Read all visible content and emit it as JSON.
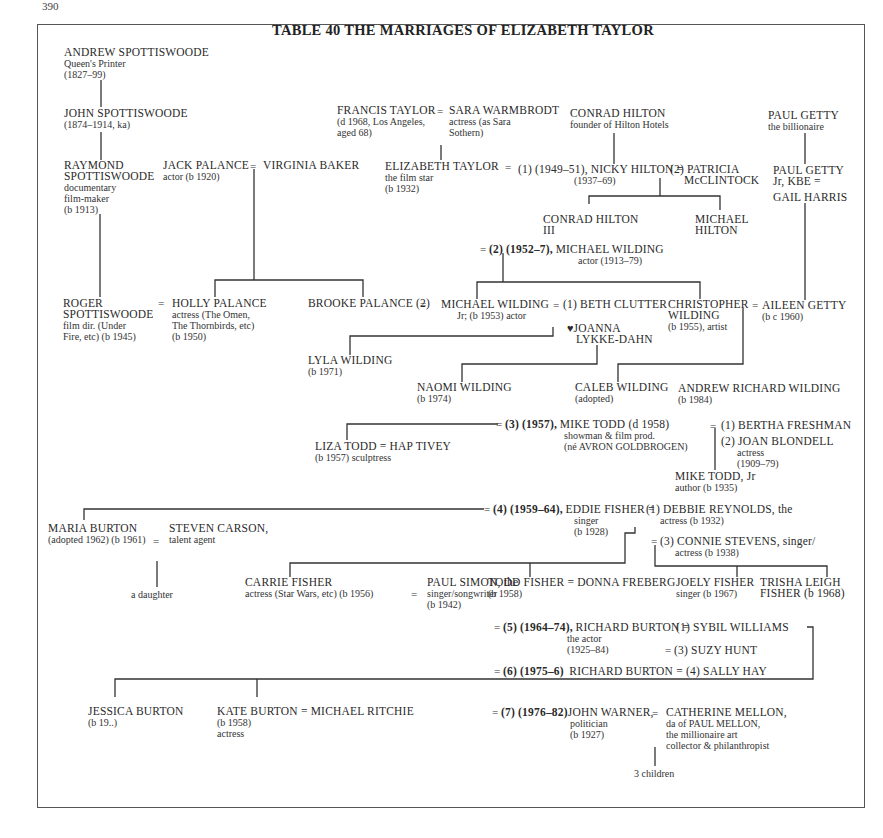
{
  "page_number": "390",
  "title": "TABLE 40 THE MARRIAGES OF ELIZABETH TAYLOR",
  "people": {
    "andrew_spottiswoode": {
      "name": "ANDREW SPOTTISWOODE",
      "line1": "Queen's Printer",
      "line2": "(1827–99)"
    },
    "john_spottiswoode": {
      "name": "JOHN SPOTTISWOODE",
      "line1": "(1874–1914, ka)"
    },
    "raymond_spottiswoode": {
      "name1": "RAYMOND",
      "name2": "SPOTTISWOODE",
      "line1": "documentary",
      "line2": "film-maker",
      "line3": "(b 1913)"
    },
    "roger_spottiswoode": {
      "name1": "ROGER",
      "name2": "SPOTTISWOODE",
      "line1": "film dir. (Under",
      "line2": "Fire, etc) (b 1945)"
    },
    "jack_palance": {
      "name": "JACK PALANCE",
      "line1": "actor (b 1920)"
    },
    "virginia_baker": {
      "name": "VIRGINIA BAKER"
    },
    "holly_palance": {
      "name": "HOLLY PALANCE",
      "line1": "actress (The Omen,",
      "line2": "The Thornbirds, etc)",
      "line3": "(b 1950)"
    },
    "brooke_palance": {
      "name": "BROOKE PALANCE (2)"
    },
    "francis_taylor": {
      "name": "FRANCIS TAYLOR",
      "line1": "(d 1968, Los Angeles,",
      "line2": "aged 68)"
    },
    "sara_warmbrodt": {
      "name": "SARA WARMBRODT",
      "line1": "actress (as Sara",
      "line2": "Sothern)"
    },
    "elizabeth_taylor": {
      "name": "ELIZABETH TAYLOR",
      "line1": "the film star",
      "line2": "(b 1932)"
    },
    "conrad_hilton": {
      "name": "CONRAD HILTON",
      "line1": "founder of Hilton Hotels"
    },
    "nicky_hilton": {
      "marriage": "(1) (1949–51),",
      "name": "NICKY HILTON",
      "line1": "(1937–69)"
    },
    "patricia_mcclintock": {
      "name1": "(2) PATRICIA",
      "name2": "McCLINTOCK"
    },
    "conrad_hilton_iii": {
      "name1": "CONRAD HILTON",
      "name2": "III"
    },
    "michael_hilton": {
      "name1": "MICHAEL",
      "name2": "HILTON"
    },
    "paul_getty": {
      "name": "PAUL GETTY",
      "line1": "the billionaire"
    },
    "paul_getty_jr": {
      "name1": "PAUL GETTY",
      "name2": "Jr, KBE  ="
    },
    "gail_harris": {
      "name": "GAIL HARRIS"
    },
    "michael_wilding": {
      "marriage": "(2) (1952–7),",
      "name": "MICHAEL WILDING",
      "line1": "actor (1913–79)"
    },
    "michael_wilding_jr": {
      "name": "MICHAEL WILDING",
      "line1": "Jr; (b 1953) actor"
    },
    "beth_clutter": {
      "name": "(1) BETH CLUTTER"
    },
    "joanna_lykke_dahn": {
      "name1": "JOANNA",
      "name2": "LYKKE-DAHN",
      "symbol": "♥"
    },
    "christopher_wilding": {
      "name1": "CHRISTOPHER",
      "name2": "WILDING",
      "line1": "(b 1955), artist"
    },
    "aileen_getty": {
      "name": "AILEEN GETTY",
      "line1": "(b c 1960)"
    },
    "lyla_wilding": {
      "name": "LYLA WILDING",
      "line1": "(b 1971)"
    },
    "naomi_wilding": {
      "name": "NAOMI WILDING",
      "line1": "(b 1974)"
    },
    "caleb_wilding": {
      "name": "CALEB WILDING",
      "line1": "(adopted)"
    },
    "andrew_richard_wilding": {
      "name": "ANDREW RICHARD WILDING",
      "line1": "(b 1984)"
    },
    "mike_todd": {
      "marriage": "(3) (1957),",
      "name": "MIKE TODD (d 1958)",
      "line1": "showman & film prod.",
      "line2": "(né AVRON GOLDBROGEN)"
    },
    "bertha_freshman": {
      "name": "(1) BERTHA FRESHMAN"
    },
    "joan_blondell": {
      "name": "(2) JOAN BLONDELL",
      "line1": "actress",
      "line2": "(1909–79)"
    },
    "mike_todd_jr": {
      "name": "MIKE TODD, Jr",
      "line1": "author (b 1935)"
    },
    "liza_todd": {
      "name": "LIZA TODD",
      "line1": "(b 1957) sculptress"
    },
    "hap_tivey": {
      "name": "HAP TIVEY"
    },
    "eddie_fisher": {
      "marriage": "(4) (1959–64),",
      "name": "EDDIE FISHER",
      "line1": "singer",
      "line2": "(b 1928)"
    },
    "debbie_reynolds": {
      "name": "(1) DEBBIE REYNOLDS, the",
      "line1": "actress (b 1932)"
    },
    "connie_stevens": {
      "name": "(3) CONNIE STEVENS, singer/",
      "line1": "actress (b 1938)"
    },
    "maria_burton": {
      "name": "MARIA BURTON",
      "line1": "(adopted 1962) (b 1961)"
    },
    "steven_carson": {
      "name": "STEVEN CARSON,",
      "line1": "talent agent"
    },
    "a_daughter": {
      "name": "a daughter"
    },
    "carrie_fisher": {
      "name": "CARRIE FISHER",
      "line1": "actress (Star Wars, etc) (b 1956)"
    },
    "paul_simon": {
      "name": "PAUL SIMON, the",
      "line1": "singer/songwriter",
      "line2": "(b 1942)"
    },
    "todd_fisher": {
      "name": "TODD FISHER",
      "line1": "(b 1958)"
    },
    "donna_freberg": {
      "name": "DONNA FREBERG"
    },
    "joely_fisher": {
      "name": "JOELY FISHER",
      "line1": "singer (b 1967)"
    },
    "trisha_leigh_fisher": {
      "name1": "TRISHA LEIGH",
      "name2": "FISHER (b 1968)"
    },
    "richard_burton_5": {
      "marriage": "(5) (1964–74),",
      "name": "RICHARD BURTON",
      "line1": "the actor",
      "line2": "(1925–84)"
    },
    "sybil_williams": {
      "name": "(1) SYBIL WILLIAMS"
    },
    "suzy_hunt": {
      "name": "(3) SUZY HUNT"
    },
    "richard_burton_6": {
      "marriage": "(6) (1975–6)",
      "name": "RICHARD BURTON"
    },
    "sally_hay": {
      "name": "(4) SALLY HAY"
    },
    "jessica_burton": {
      "name": "JESSICA BURTON",
      "line1": "(b 19..)"
    },
    "kate_burton": {
      "name": "KATE BURTON",
      "line1": "(b 1958)",
      "line2": "actress"
    },
    "michael_ritchie": {
      "name": "MICHAEL RITCHIE"
    },
    "john_warner": {
      "marriage": "(7) (1976–82)",
      "name": "JOHN WARNER,",
      "line1": "politician",
      "line2": "(b 1927)"
    },
    "catherine_mellon": {
      "name": "CATHERINE MELLON,",
      "line1": "da of PAUL MELLON,",
      "line2": "the millionaire art",
      "line3": "collector & philanthropist"
    },
    "three_children": {
      "name": "3 children"
    }
  },
  "symbols": {
    "marriage": "="
  }
}
